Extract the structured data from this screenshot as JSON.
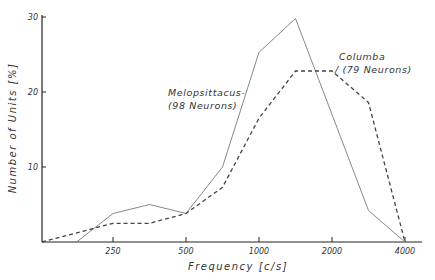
{
  "chart_data": {
    "type": "line",
    "title": "",
    "xlabel": "Frequency [c/s]",
    "ylabel": "Number of Units [%]",
    "xscale": "log2",
    "xlim": [
      125,
      4200
    ],
    "ylim": [
      0,
      30
    ],
    "xticks": [
      250,
      500,
      1000,
      2000,
      4000
    ],
    "xtick_labels": [
      "250",
      "500",
      "1000",
      "2000",
      "4000"
    ],
    "yticks": [
      10,
      20,
      30
    ],
    "ytick_labels": [
      "10",
      "20",
      "30"
    ],
    "grid": false,
    "legend": "none",
    "series": [
      {
        "name": "Melopsittacus",
        "style": "solid",
        "annotation": [
          "Melopsittacus-",
          "(98 Neurons)"
        ],
        "x": [
          177,
          250,
          354,
          500,
          707,
          1000,
          1414,
          2828,
          4000
        ],
        "y": [
          0,
          3.8,
          5.0,
          3.8,
          10.0,
          25.3,
          29.8,
          4.2,
          0
        ]
      },
      {
        "name": "Columba",
        "style": "dashed",
        "annotation": [
          "Columba",
          "/ (79 Neurons)"
        ],
        "x": [
          125,
          250,
          354,
          500,
          707,
          1000,
          1414,
          2000,
          2828,
          4000
        ],
        "y": [
          0,
          2.5,
          2.5,
          3.8,
          7.3,
          16.5,
          22.8,
          22.8,
          18.6,
          0
        ]
      }
    ]
  }
}
